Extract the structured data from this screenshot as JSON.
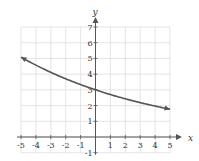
{
  "chart_data": {
    "type": "line",
    "title": "",
    "xlabel": "x",
    "ylabel": "y",
    "xlim": [
      -5,
      5
    ],
    "ylim": [
      -1,
      7
    ],
    "grid": true,
    "x_ticks": [
      -5,
      -4,
      -3,
      -2,
      -1,
      1,
      2,
      3,
      4,
      5
    ],
    "y_ticks": [
      -1,
      1,
      2,
      3,
      4,
      5,
      6,
      7
    ],
    "series": [
      {
        "name": "exponential decay",
        "function": "3*(0.9)^x",
        "x": [
          -5,
          -4,
          -3,
          -2,
          -1,
          0,
          1,
          2,
          3,
          4,
          5
        ],
        "values": [
          5.08,
          4.57,
          4.12,
          3.7,
          3.33,
          3.0,
          2.7,
          2.43,
          2.19,
          1.97,
          1.77
        ],
        "arrows": "both",
        "color": "#555555"
      }
    ]
  },
  "layout": {
    "x0px": 21,
    "x1px": 170,
    "y7px": 27,
    "y0px": 137,
    "grid_color": "#dddddd",
    "axis_color": "#555555"
  }
}
